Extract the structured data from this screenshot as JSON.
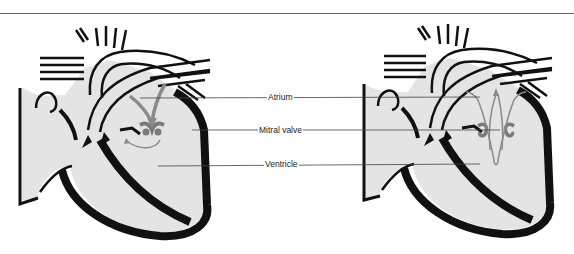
{
  "figure": {
    "labels": [
      {
        "id": "atrium",
        "text": "Atrium"
      },
      {
        "id": "mitral-valve",
        "text": "Mitral valve"
      },
      {
        "id": "ventricle",
        "text": "Ventricle"
      }
    ],
    "panels": [
      {
        "id": "left-heart",
        "state": "valve-open"
      },
      {
        "id": "right-heart",
        "state": "valve-closed"
      }
    ],
    "colors": {
      "wall": "#111111",
      "chamber": "#e4e4e4",
      "valve": "#7a7a7a",
      "flow_arrow": "#8a8a8a",
      "leader_line": "#444444"
    }
  }
}
